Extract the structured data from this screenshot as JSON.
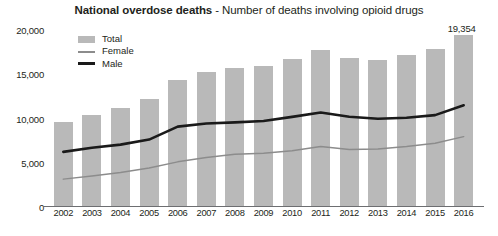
{
  "title": {
    "bold": "National overdose deaths",
    "separator": " - ",
    "rest": "Number of deaths involving opioid drugs"
  },
  "legend": {
    "items": [
      {
        "label": "Total",
        "style": "area-swatch",
        "color": "#b9b9b9"
      },
      {
        "label": "Female",
        "style": "thin-line",
        "color": "#8c8c8c"
      },
      {
        "label": "Male",
        "style": "thick-line",
        "color": "#1a1a1a"
      }
    ]
  },
  "axis": {
    "yticks": [
      "20,000",
      "15,000",
      "10,000",
      "5,000",
      "0"
    ],
    "xticks": [
      "2002",
      "2003",
      "2004",
      "2005",
      "2006",
      "2007",
      "2008",
      "2009",
      "2010",
      "2011",
      "2012",
      "2013",
      "2014",
      "2015",
      "2016"
    ]
  },
  "annotations": [
    {
      "name": "total-2016-value",
      "text": "19,354"
    }
  ],
  "caption": {
    "text": ""
  },
  "chart_data": {
    "type": "bar",
    "title": "National overdose deaths - Number of deaths involving opioid drugs",
    "xlabel": "",
    "ylabel": "",
    "ylim": [
      0,
      20000
    ],
    "yticks": [
      0,
      5000,
      10000,
      15000,
      20000
    ],
    "grid": false,
    "legend_position": "top-left inside plot",
    "categories": [
      "2002",
      "2003",
      "2004",
      "2005",
      "2006",
      "2007",
      "2008",
      "2009",
      "2010",
      "2011",
      "2012",
      "2013",
      "2014",
      "2015",
      "2016"
    ],
    "series": [
      {
        "name": "Total",
        "type": "bar",
        "color": "#b9b9b9",
        "values": [
          9489,
          10287,
          11061,
          12127,
          14258,
          15169,
          15581,
          15829,
          16651,
          17639,
          16723,
          16543,
          17044,
          17782,
          19354
        ]
      },
      {
        "name": "Male",
        "type": "line",
        "color": "#1a1a1a",
        "values": [
          6225,
          6700,
          7050,
          7620,
          9085,
          9440,
          9560,
          9720,
          10180,
          10680,
          10200,
          9980,
          10080,
          10380,
          11500
        ]
      },
      {
        "name": "Female",
        "type": "line",
        "color": "#8c8c8c",
        "values": [
          3150,
          3500,
          3900,
          4400,
          5100,
          5600,
          5950,
          6080,
          6350,
          6830,
          6500,
          6560,
          6830,
          7200,
          7950
        ]
      }
    ],
    "data_labels": [
      {
        "series": "Total",
        "category": "2016",
        "text": "19,354"
      }
    ]
  }
}
